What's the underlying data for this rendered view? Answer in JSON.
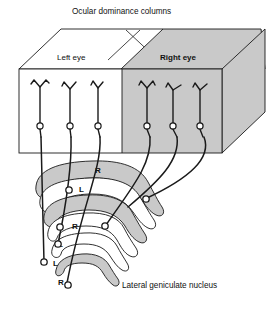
{
  "figure": {
    "title": "Ocular dominance columns",
    "lgn_label": "Lateral geniculate nucleus",
    "cortex_block": {
      "left_half_label": "Left eye",
      "right_half_label": "Right eye"
    },
    "colors": {
      "shaded_gray": "#c9c9c9",
      "white": "#ffffff",
      "stroke": "#1a1a1a",
      "background": "#ffffff"
    },
    "cortical_neurons": [
      {
        "eye": "Left eye",
        "column": 1
      },
      {
        "eye": "Left eye",
        "column": 2
      },
      {
        "eye": "Left eye",
        "column": 3
      },
      {
        "eye": "Right eye",
        "column": 4
      },
      {
        "eye": "Right eye",
        "column": 5
      },
      {
        "eye": "Right eye",
        "column": 6
      }
    ],
    "lgn_layers": [
      {
        "index": 1,
        "label": "R",
        "shaded": true
      },
      {
        "index": 2,
        "label": "L",
        "shaded": false
      },
      {
        "index": 3,
        "label": "R",
        "shaded": true
      },
      {
        "index": 4,
        "label": "L",
        "shaded": false
      },
      {
        "index": 5,
        "label": "L",
        "shaded": false
      },
      {
        "index": 6,
        "label": "R",
        "shaded": true
      }
    ],
    "layer_labels": [
      "R",
      "L",
      "R",
      "L",
      "L",
      "R"
    ]
  }
}
